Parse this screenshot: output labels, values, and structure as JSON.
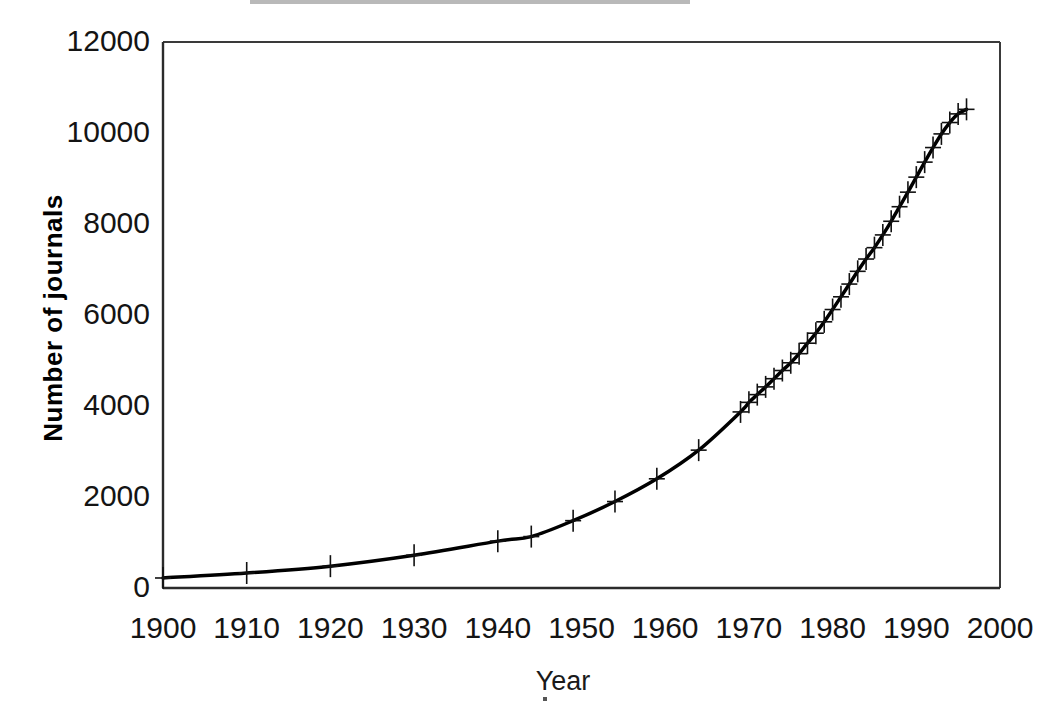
{
  "chart_data": {
    "type": "line",
    "title": "",
    "xlabel": "Year",
    "ylabel": "Number of journals",
    "xlim": [
      1900,
      2000
    ],
    "ylim": [
      0,
      12000
    ],
    "xticks": [
      1900,
      1910,
      1920,
      1930,
      1940,
      1950,
      1960,
      1970,
      1980,
      1990,
      2000
    ],
    "xtick_labels": [
      "1900",
      "1910",
      "1920",
      "1930",
      "1940",
      "1950",
      "1960",
      "1970",
      "1980",
      "1990",
      "2000"
    ],
    "yticks": [
      0,
      2000,
      4000,
      6000,
      8000,
      10000,
      12000
    ],
    "ytick_labels": [
      "0",
      "2000",
      "4000",
      "6000",
      "8000",
      "10000",
      "12000"
    ],
    "grid": false,
    "legend": false,
    "marker": "plus",
    "line_color": "#000000",
    "line_width": 3.5,
    "series": [
      {
        "name": "Number of journals",
        "x": [
          1900,
          1910,
          1920,
          1930,
          1940,
          1944,
          1949,
          1954,
          1959,
          1964,
          1969,
          1970,
          1971,
          1972,
          1973,
          1974,
          1975,
          1976,
          1977,
          1978,
          1979,
          1980,
          1981,
          1982,
          1983,
          1984,
          1985,
          1986,
          1987,
          1988,
          1989,
          1990,
          1991,
          1992,
          1993,
          1994,
          1995,
          1996
        ],
        "y": [
          220,
          330,
          480,
          720,
          1030,
          1130,
          1480,
          1900,
          2400,
          3030,
          3870,
          4080,
          4250,
          4420,
          4600,
          4780,
          4950,
          5150,
          5380,
          5600,
          5850,
          6120,
          6400,
          6680,
          6960,
          7230,
          7480,
          7760,
          8060,
          8380,
          8700,
          9030,
          9360,
          9680,
          9980,
          10230,
          10420,
          10520
        ]
      }
    ]
  },
  "axes": {
    "y_title": "Number of journals",
    "x_title": "Year"
  }
}
